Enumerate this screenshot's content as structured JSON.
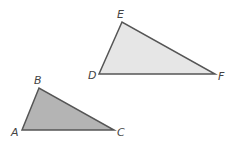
{
  "diagram": {
    "background": "#ffffff",
    "stroke_color": "#555555",
    "triangles": [
      {
        "name": "DEF",
        "fill": "#e6e6e6",
        "vertices": [
          {
            "label": "D",
            "x": 99,
            "y": 74,
            "lx": 88,
            "ly": 79
          },
          {
            "label": "E",
            "x": 122,
            "y": 22,
            "lx": 117,
            "ly": 18
          },
          {
            "label": "F",
            "x": 215,
            "y": 74,
            "lx": 218,
            "ly": 80
          }
        ]
      },
      {
        "name": "ABC",
        "fill": "#b4b4b4",
        "vertices": [
          {
            "label": "A",
            "x": 22,
            "y": 130,
            "lx": 11,
            "ly": 136
          },
          {
            "label": "B",
            "x": 39,
            "y": 88,
            "lx": 34,
            "ly": 84
          },
          {
            "label": "C",
            "x": 114,
            "y": 130,
            "lx": 117,
            "ly": 136
          }
        ]
      }
    ]
  }
}
